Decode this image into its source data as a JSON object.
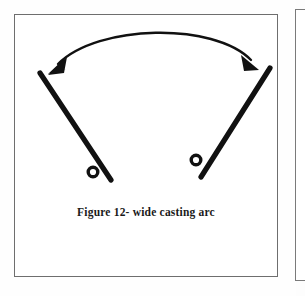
{
  "document": {
    "type": "scanned-figure",
    "background_color": "#ffffff",
    "ink_color": "#111111",
    "frame_border_color": "#6e6e6e"
  },
  "figure": {
    "caption": "Figure 12- wide casting arc",
    "caption_style": "bold-serif",
    "elements": {
      "left_rod": {
        "name": "fishing-rod-left",
        "tip": [
          40,
          73
        ],
        "butt": [
          111,
          180
        ],
        "reel_center": [
          95,
          172
        ],
        "reel_radius": 5,
        "stroke_width": 5
      },
      "right_rod": {
        "name": "fishing-rod-right",
        "tip": [
          270,
          68
        ],
        "butt": [
          200,
          177
        ],
        "reel_center": [
          196,
          160
        ],
        "reel_radius": 5,
        "stroke_width": 5
      },
      "casting_arc": {
        "name": "double-headed-arc-arrow",
        "start": [
          56,
          62
        ],
        "control_1": [
          96,
          24
        ],
        "control_2": [
          215,
          22
        ],
        "end": [
          253,
          58
        ],
        "stroke_width": 2.2,
        "arrowheads": [
          "start",
          "end"
        ],
        "meaning": "wide casting arc sweep between rod positions"
      }
    }
  },
  "adjacent_page_frame": {
    "label": "partial-neighbouring-frame",
    "visible": true
  }
}
